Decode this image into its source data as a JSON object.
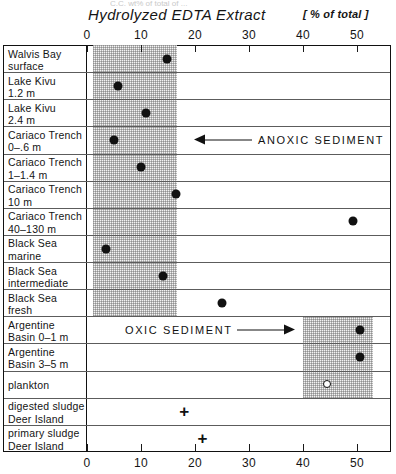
{
  "title": {
    "main": "Hydrolyzed  EDTA  Extract",
    "unit": "[ % of total ]",
    "cut_off_header": "C.C. wt% of total of ..."
  },
  "axis": {
    "ticks": [
      "0",
      "10",
      "20",
      "30",
      "40",
      "50"
    ],
    "tick_values": [
      0,
      10,
      20,
      30,
      40,
      50
    ],
    "xmin": 0,
    "xmax": 54.5,
    "label_top": true,
    "label_bottom": true
  },
  "annotations": [
    {
      "text": "ANOXIC SEDIMENT",
      "arrow": "left",
      "row_index": 3
    },
    {
      "text": "OXIC SEDIMENT",
      "arrow": "right",
      "row_index": 10
    }
  ],
  "bands": [
    {
      "name": "anoxic-band",
      "from": 1.1,
      "to": 16.6,
      "row_start": 0,
      "row_end": 9
    },
    {
      "name": "oxic-band",
      "from": 40.0,
      "to": 53.0,
      "row_start": 10,
      "row_end": 12
    }
  ],
  "rows": [
    {
      "label_line1": "Walvis Bay",
      "label_line2": "surface",
      "value": 14.8,
      "marker": "filled-circle"
    },
    {
      "label_line1": "Lake Kivu",
      "label_line2": "1.2 m",
      "value": 5.7,
      "marker": "filled-circle"
    },
    {
      "label_line1": "Lake Kivu",
      "label_line2": "2.4 m",
      "value": 11.0,
      "marker": "filled-circle"
    },
    {
      "label_line1": "Cariaco Trench",
      "label_line2": "0–.6 m",
      "value": 5.0,
      "marker": "filled-circle"
    },
    {
      "label_line1": "Cariaco Trench",
      "label_line2": "1–1.4 m",
      "value": 10.0,
      "marker": "filled-circle"
    },
    {
      "label_line1": "Cariaco Trench",
      "label_line2": "10 m",
      "value": 16.4,
      "marker": "filled-circle"
    },
    {
      "label_line1": "Cariaco Trench",
      "label_line2": "40–130 m",
      "value": 49.2,
      "marker": "filled-circle"
    },
    {
      "label_line1": "Black Sea",
      "label_line2": "marine",
      "value": 3.6,
      "marker": "filled-circle"
    },
    {
      "label_line1": "Black Sea",
      "label_line2": "intermediate",
      "value": 14.0,
      "marker": "filled-circle"
    },
    {
      "label_line1": "Black Sea",
      "label_line2": "fresh",
      "value": 25.0,
      "marker": "filled-circle"
    },
    {
      "label_line1": "Argentine",
      "label_line2": "Basin  0–1 m",
      "value": 50.6,
      "marker": "filled-circle"
    },
    {
      "label_line1": "Argentine",
      "label_line2": "Basin  3–5 m",
      "value": 50.6,
      "marker": "filled-circle"
    },
    {
      "label_line1": "plankton",
      "label_line2": "",
      "value": 44.5,
      "marker": "open-circle"
    },
    {
      "label_line1": "digested sludge",
      "label_line2": "Deer  Island",
      "value": 18.0,
      "marker": "cross"
    },
    {
      "label_line1": "primary sludge",
      "label_line2": "Deer  Island",
      "value": 21.4,
      "marker": "cross"
    }
  ],
  "chart_data": {
    "type": "scatter",
    "title": "Hydrolyzed EDTA Extract",
    "xlabel": "[ % of total ]",
    "ylabel": "",
    "xlim": [
      0,
      54.5
    ],
    "xticks": [
      0,
      10,
      20,
      30,
      40,
      50
    ],
    "grid": false,
    "legend": null,
    "categories": [
      "Walvis Bay surface",
      "Lake Kivu 1.2 m",
      "Lake Kivu 2.4 m",
      "Cariaco Trench 0–.6 m",
      "Cariaco Trench 1–1.4 m",
      "Cariaco Trench 10 m",
      "Cariaco Trench 40–130 m",
      "Black Sea marine",
      "Black Sea intermediate",
      "Black Sea fresh",
      "Argentine Basin 0–1 m",
      "Argentine Basin 3–5 m",
      "plankton",
      "digested sludge Deer Island",
      "primary sludge Deer Island"
    ],
    "values": [
      14.8,
      5.7,
      11.0,
      5.0,
      10.0,
      16.4,
      49.2,
      3.6,
      14.0,
      25.0,
      50.6,
      50.6,
      44.5,
      18.0,
      21.4
    ],
    "markers": [
      "filled-circle",
      "filled-circle",
      "filled-circle",
      "filled-circle",
      "filled-circle",
      "filled-circle",
      "filled-circle",
      "filled-circle",
      "filled-circle",
      "filled-circle",
      "filled-circle",
      "filled-circle",
      "open-circle",
      "cross",
      "cross"
    ],
    "shaded_ranges": [
      {
        "label": "anoxic sediment range",
        "x_from": 1.1,
        "x_to": 16.6
      },
      {
        "label": "oxic sediment range",
        "x_from": 40.0,
        "x_to": 53.0
      }
    ],
    "annotations": [
      "ANOXIC SEDIMENT",
      "OXIC SEDIMENT"
    ]
  }
}
